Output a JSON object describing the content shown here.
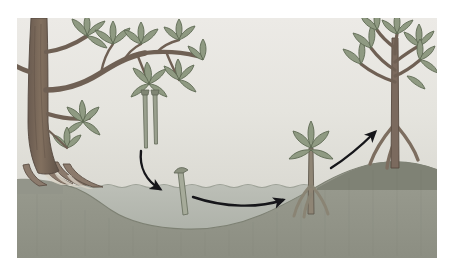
{
  "figure": {
    "title": "Mangrove propagule dispersal and establishment",
    "style": "flat vector illustration, muted desaturated palette",
    "frame": {
      "x": 17,
      "y": 18,
      "width": 420,
      "height": 240
    }
  },
  "palette": {
    "page_background": "#ffffff",
    "sky_top": "#e8e8e4",
    "sky_bottom": "#dcdcd6",
    "water_top": "#b9bcb4",
    "water_bottom": "#a9ada4",
    "water_line": "#a8aca3",
    "seabed_near": "#9a9c90",
    "seabed_far": "#8e9084",
    "seabed_dark": "#7e8175",
    "trunk_fill": "#7b6a5e",
    "trunk_shadow": "#5e5046",
    "branch_fill": "#6f6054",
    "leaf_fill": "#8f9a82",
    "leaf_shadow": "#79846c",
    "leaf_stroke": "#5f6a54",
    "propagule_fill": "#9aa08e",
    "propagule_stroke": "#6d7463",
    "arrow_color": "#16161a",
    "root_fill": "#8b7a6c",
    "root_highlight": "#d8d2c6"
  },
  "scene": {
    "sky": {
      "label": "sky",
      "region": "upper area above waterline"
    },
    "water": {
      "label": "tidal water",
      "surface_y": 168,
      "wave_amplitude": 2,
      "description": "shallow coastal water with gently wavy surface"
    },
    "seabed": {
      "label": "sediment seabed",
      "description": "sloping muddy bottom, deep at centre-left, rising to the right bank"
    }
  },
  "elements": [
    {
      "id": "parent-tree",
      "name": "mature-mangrove-tree",
      "label": "Mature parent mangrove tree",
      "stage_number": 1,
      "position": "left edge",
      "features": [
        "thick trunk",
        "arching branches",
        "lance-shaped leaves",
        "exposed prop roots"
      ]
    },
    {
      "id": "hanging-propagules",
      "name": "hanging-propagules",
      "label": "Pencil-shaped propagules hanging from parent branch",
      "stage_number": 2,
      "count": 2,
      "position": "under centre-left branch"
    },
    {
      "id": "floating-propagule",
      "name": "floating-propagule",
      "label": "Detached propagule floating upright in the water",
      "stage_number": 3,
      "position": "centre, at the waterline"
    },
    {
      "id": "rooted-seedling",
      "name": "rooted-seedling",
      "label": "Propagule stranded and rooting in the sediment with first leaves",
      "stage_number": 4,
      "position": "centre-right shallows"
    },
    {
      "id": "young-sapling",
      "name": "young-mangrove-sapling",
      "label": "Established young mangrove sapling with prop roots",
      "stage_number": 5,
      "position": "right bank above the waterline"
    }
  ],
  "arrows": [
    {
      "id": "arrow-drop",
      "name": "arrow-propagule-drops",
      "label": "Propagule drops from parent tree into the water",
      "from": "hanging-propagules",
      "to": "floating-propagule",
      "shape": "short curved arc, bends down and to the right"
    },
    {
      "id": "arrow-float",
      "name": "arrow-propagule-floats",
      "label": "Propagule drifts with the tide to a new site",
      "from": "floating-propagule",
      "to": "rooted-seedling",
      "shape": "long shallow arc along the waterline, pointing right"
    },
    {
      "id": "arrow-grow",
      "name": "arrow-seedling-grows",
      "label": "Rooted seedling grows into a young tree",
      "from": "rooted-seedling",
      "to": "young-sapling",
      "shape": "upward curved arc, pointing up and to the right"
    }
  ]
}
